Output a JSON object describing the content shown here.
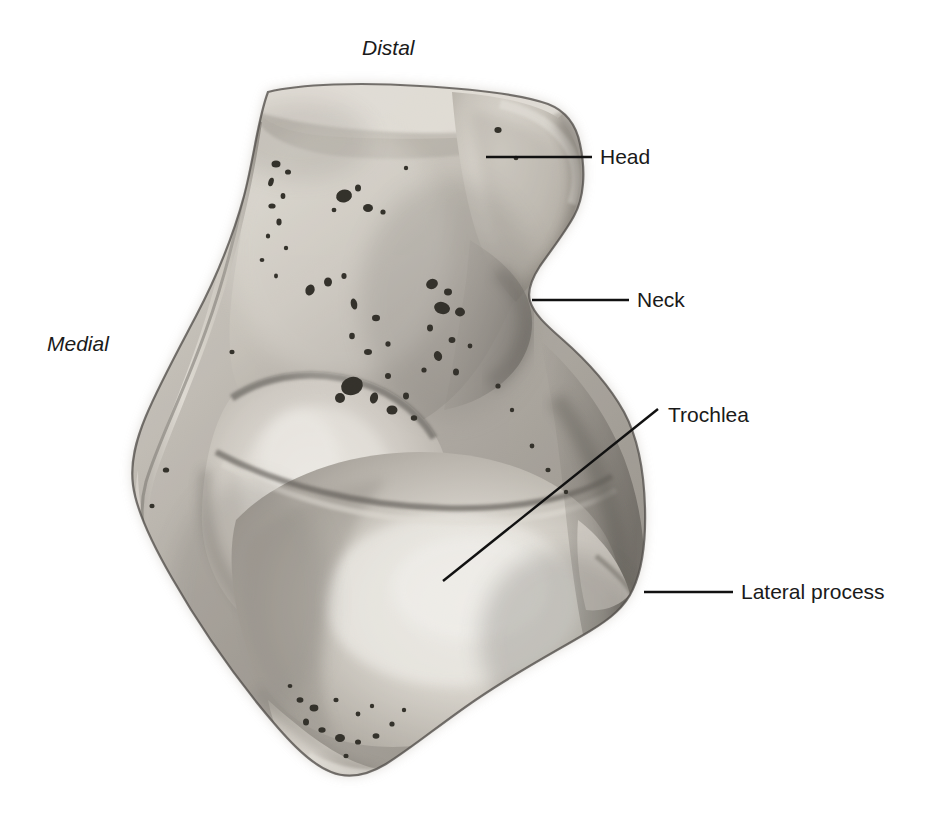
{
  "figure": {
    "view": "dorsal-superior",
    "background_color": "#ffffff",
    "text_color": "#1a1a1a",
    "leader_line_color": "#111111"
  },
  "orientation_labels": [
    {
      "id": "distal",
      "text": "Distal",
      "style": "italic",
      "x": 362,
      "y": 36
    },
    {
      "id": "medial",
      "text": "Medial",
      "style": "italic",
      "x": 47,
      "y": 332
    }
  ],
  "annotations": [
    {
      "id": "head",
      "text": "Head",
      "label_x": 600,
      "label_y": 145,
      "leader": {
        "x1": 486,
        "y1": 157,
        "x2": 592,
        "y2": 157
      }
    },
    {
      "id": "neck",
      "text": "Neck",
      "label_x": 637,
      "label_y": 288,
      "leader": {
        "x1": 532,
        "y1": 300,
        "x2": 629,
        "y2": 300
      }
    },
    {
      "id": "trochlea",
      "text": "Trochlea",
      "label_x": 668,
      "label_y": 403,
      "leader": {
        "x1": 443,
        "y1": 581,
        "x2": 658,
        "y2": 409
      }
    },
    {
      "id": "lateral-process",
      "text": "Lateral process",
      "label_x": 741,
      "label_y": 580,
      "leader": {
        "x1": 644,
        "y1": 592,
        "x2": 733,
        "y2": 592
      }
    }
  ],
  "specimen": {
    "name": "talus",
    "regions": [
      "head",
      "neck",
      "trochlea",
      "lateral process",
      "medial surface",
      "posterior body"
    ],
    "bounds": {
      "left": 132,
      "top": 84,
      "right": 645,
      "bottom": 778
    },
    "palette": {
      "highlight": "#f2f0ec",
      "light": "#d9d5cf",
      "mid": "#b3aea7",
      "shadow": "#8a857f",
      "deep_shadow": "#5d5954",
      "outline": "#3a3733",
      "foramen": "#161412"
    }
  }
}
